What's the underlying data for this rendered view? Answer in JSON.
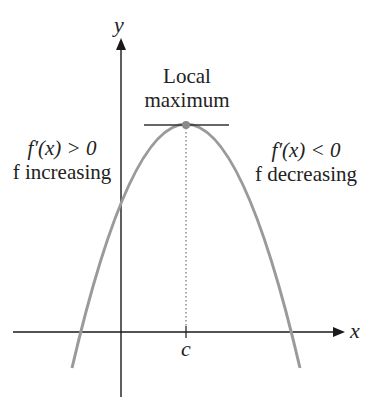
{
  "axes": {
    "x_label": "x",
    "y_label": "y",
    "tick_label": "c"
  },
  "annotations": {
    "top": [
      "Local",
      "maximum"
    ],
    "left": {
      "derivative": "f′(x) > 0",
      "behavior": "f increasing"
    },
    "right": {
      "derivative": "f′(x) < 0",
      "behavior": "f decreasing"
    }
  },
  "colors": {
    "axis": "#1a1a1a",
    "curve": "#9a9a9a",
    "text": "#222222"
  }
}
